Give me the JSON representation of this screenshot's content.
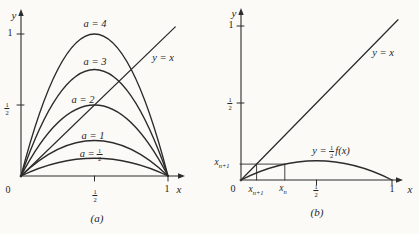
{
  "colors": {
    "background": "#fbfaf7",
    "ink": "#2b2b2b"
  },
  "fraction": {
    "num": "1",
    "den": "2"
  },
  "panel_a": {
    "caption": "(a)",
    "axis": {
      "y": "y",
      "x": "x",
      "origin": "0",
      "one_y": "1",
      "one_x": "1"
    },
    "curve_labels": {
      "a4": "a = 4",
      "a3": "a = 3",
      "a2": "a = 2",
      "a1": "a = 1",
      "a_half_prefix": "a ="
    },
    "line_label": "y = x"
  },
  "panel_b": {
    "caption": "(b)",
    "axis": {
      "y": "y",
      "x": "x",
      "origin": "0",
      "one_y": "1",
      "one_x": "1"
    },
    "line_label": "y = x",
    "curve_label": {
      "prefix": "y =",
      "suffix": "f(x)"
    },
    "x_sub_n": {
      "base": "x",
      "sub": "n"
    },
    "x_sub_n_plus_1": {
      "base": "x",
      "sub": "n+1"
    }
  },
  "chart_data": [
    {
      "type": "line",
      "panel": "a",
      "title": "(a)",
      "xlabel": "x",
      "ylabel": "y",
      "xlim": [
        0,
        1.1
      ],
      "ylim": [
        0,
        1.15
      ],
      "grid": false,
      "x_ticks": [
        {
          "v": 0.5,
          "label": "1/2"
        },
        {
          "v": 1,
          "label": "1"
        }
      ],
      "y_ticks": [
        {
          "v": 0.5,
          "label": "1/2"
        },
        {
          "v": 1,
          "label": "1"
        }
      ],
      "series": [
        {
          "name": "a = 4",
          "kind": "parabola",
          "peak": 1.0,
          "points": {
            "x": [
              0,
              0.25,
              0.5,
              0.75,
              1
            ],
            "y": [
              0,
              0.75,
              1.0,
              0.75,
              0
            ]
          }
        },
        {
          "name": "a = 3",
          "kind": "parabola",
          "peak": 0.75,
          "points": {
            "x": [
              0,
              0.25,
              0.5,
              0.75,
              1
            ],
            "y": [
              0,
              0.5625,
              0.75,
              0.5625,
              0
            ]
          }
        },
        {
          "name": "a = 2",
          "kind": "parabola",
          "peak": 0.5,
          "points": {
            "x": [
              0,
              0.25,
              0.5,
              0.75,
              1
            ],
            "y": [
              0,
              0.375,
              0.5,
              0.375,
              0
            ]
          }
        },
        {
          "name": "a = 1",
          "kind": "parabola",
          "peak": 0.25,
          "points": {
            "x": [
              0,
              0.25,
              0.5,
              0.75,
              1
            ],
            "y": [
              0,
              0.1875,
              0.25,
              0.1875,
              0
            ]
          }
        },
        {
          "name": "a = 1/2",
          "kind": "parabola",
          "peak": 0.125,
          "points": {
            "x": [
              0,
              0.25,
              0.5,
              0.75,
              1
            ],
            "y": [
              0,
              0.09375,
              0.125,
              0.09375,
              0
            ]
          }
        },
        {
          "name": "y = x",
          "kind": "line",
          "points": {
            "x": [
              0,
              1.05
            ],
            "y": [
              0,
              1.05
            ]
          }
        }
      ]
    },
    {
      "type": "line",
      "panel": "b",
      "title": "(b)",
      "xlabel": "x",
      "ylabel": "y",
      "xlim": [
        0,
        1.07
      ],
      "ylim": [
        0,
        1.09
      ],
      "grid": false,
      "x_ticks": [
        {
          "v": 0.5,
          "label": "1/2"
        },
        {
          "v": 1,
          "label": "1"
        }
      ],
      "y_ticks": [
        {
          "v": 0.5,
          "label": "1/2"
        },
        {
          "v": 1,
          "label": "1"
        }
      ],
      "series": [
        {
          "name": "y = 1/2 f(x)",
          "kind": "parabola",
          "peak": 0.125,
          "points": {
            "x": [
              0,
              0.25,
              0.5,
              0.75,
              1
            ],
            "y": [
              0,
              0.094,
              0.125,
              0.094,
              0
            ]
          }
        },
        {
          "name": "y = x",
          "kind": "line",
          "points": {
            "x": [
              0,
              1.04
            ],
            "y": [
              0,
              1.04
            ]
          }
        }
      ],
      "annotations": {
        "x_n": 0.29,
        "x_n_plus_1": 0.103
      }
    }
  ]
}
